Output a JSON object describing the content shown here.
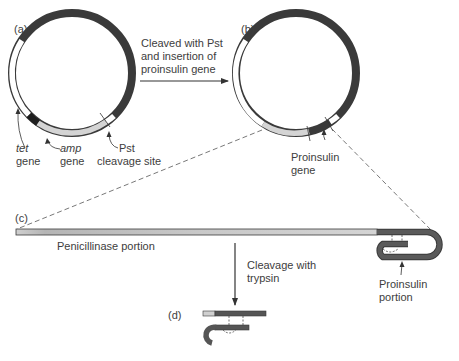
{
  "panels": {
    "a": "(a)",
    "b": "(b)",
    "c": "(c)",
    "d": "(d)"
  },
  "step1": {
    "line1": "Cleaved with Pst",
    "line2": "and insertion of",
    "line3": "proinsulin gene"
  },
  "labels_a": {
    "tet_italic": "tet",
    "tet_gene": "gene",
    "amp_italic": "amp",
    "amp_gene": "gene",
    "pst_line1": "Pst",
    "pst_line2": "cleavage site"
  },
  "labels_b": {
    "proinsulin_line1": "Proinsulin",
    "proinsulin_line2": "gene"
  },
  "labels_c": {
    "penicillinase": "Penicillinase portion",
    "proinsulin_line1": "Proinsulin",
    "proinsulin_line2": "portion"
  },
  "step2": {
    "line1": "Cleavage with",
    "line2": "trypsin"
  },
  "colors": {
    "dark_segment": "#4a4a4a",
    "light_segment": "#d2d2d2",
    "white_segment": "#ffffff",
    "tet_black": "#1e1e1e",
    "outline": "#3a3a3a"
  }
}
